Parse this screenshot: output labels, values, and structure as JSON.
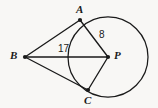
{
  "figure": {
    "kind": "circle-with-external-point-tangents",
    "background_color": "#f8f7f5",
    "stroke_color": "#1a1a1a",
    "labels": {
      "point_a": "A",
      "point_b": "B",
      "point_c": "C",
      "center_p": "P",
      "segment_bp_length": "17",
      "segment_ap_length": "8"
    },
    "points": {
      "A": {
        "x": 80,
        "y": 20
      },
      "B": {
        "x": 25,
        "y": 57
      },
      "C": {
        "x": 88,
        "y": 90
      },
      "P": {
        "x": 108,
        "y": 57
      }
    },
    "circle": {
      "cx": 108,
      "cy": 57,
      "r": 40
    },
    "segments": [
      {
        "name": "BA",
        "from": "B",
        "to": "A",
        "label": "17"
      },
      {
        "name": "BC",
        "from": "B",
        "to": "C",
        "label": ""
      },
      {
        "name": "BP",
        "from": "B",
        "to": "P",
        "label": ""
      },
      {
        "name": "AP",
        "from": "A",
        "to": "P",
        "label": "8"
      },
      {
        "name": "CP",
        "from": "C",
        "to": "P",
        "label": ""
      }
    ]
  }
}
